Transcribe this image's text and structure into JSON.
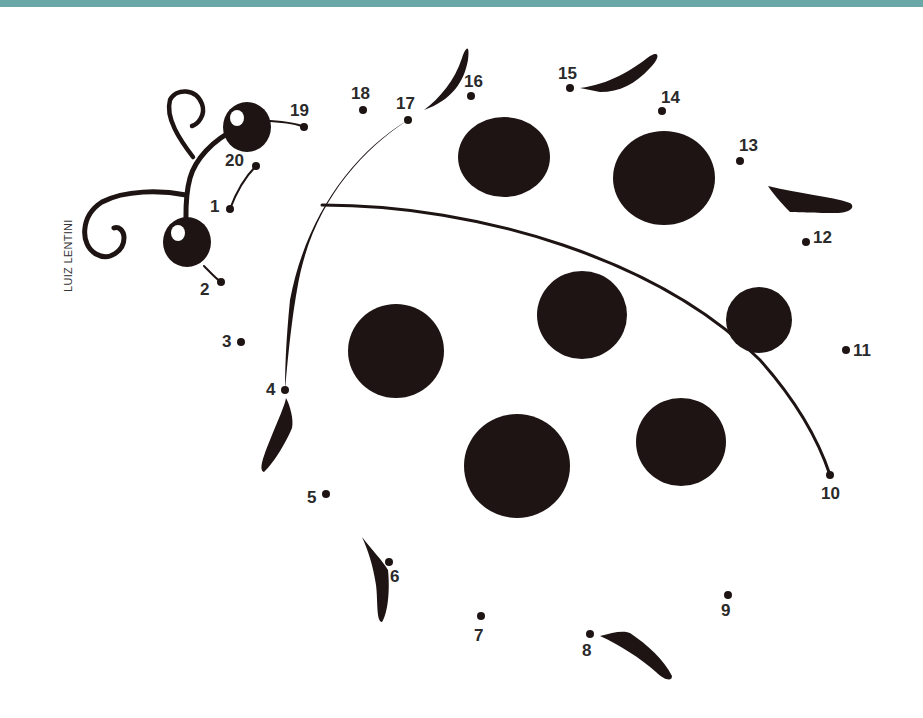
{
  "worksheet": {
    "subject": "ladybug",
    "type": "connect-the-dots",
    "credit": "LUIZ LENTINI",
    "top_bar_color": "#6aa8a8",
    "ink_color": "#1e1414",
    "eye_highlight_color": "#ffffff"
  },
  "dots": [
    {
      "n": "1",
      "x": 230,
      "y": 209,
      "lx": 210,
      "ly": 212
    },
    {
      "n": "2",
      "x": 221,
      "y": 282,
      "lx": 200,
      "ly": 295
    },
    {
      "n": "3",
      "x": 241,
      "y": 342,
      "lx": 222,
      "ly": 347
    },
    {
      "n": "4",
      "x": 285,
      "y": 390,
      "lx": 266,
      "ly": 395
    },
    {
      "n": "5",
      "x": 326,
      "y": 494,
      "lx": 307,
      "ly": 503
    },
    {
      "n": "6",
      "x": 389,
      "y": 562,
      "lx": 390,
      "ly": 582
    },
    {
      "n": "7",
      "x": 481,
      "y": 616,
      "lx": 474,
      "ly": 641
    },
    {
      "n": "8",
      "x": 590,
      "y": 634,
      "lx": 582,
      "ly": 656
    },
    {
      "n": "9",
      "x": 728,
      "y": 595,
      "lx": 721,
      "ly": 616
    },
    {
      "n": "10",
      "x": 830,
      "y": 475,
      "lx": 821,
      "ly": 499
    },
    {
      "n": "11",
      "x": 846,
      "y": 350,
      "lx": 853,
      "ly": 356
    },
    {
      "n": "12",
      "x": 806,
      "y": 242,
      "lx": 813,
      "ly": 243
    },
    {
      "n": "13",
      "x": 740,
      "y": 161,
      "lx": 739,
      "ly": 151
    },
    {
      "n": "14",
      "x": 662,
      "y": 111,
      "lx": 661,
      "ly": 103
    },
    {
      "n": "15",
      "x": 570,
      "y": 88,
      "lx": 558,
      "ly": 79
    },
    {
      "n": "16",
      "x": 471,
      "y": 96,
      "lx": 464,
      "ly": 87
    },
    {
      "n": "17",
      "x": 408,
      "y": 120,
      "lx": 396,
      "ly": 109
    },
    {
      "n": "18",
      "x": 363,
      "y": 110,
      "lx": 351,
      "ly": 99
    },
    {
      "n": "19",
      "x": 304,
      "y": 127,
      "lx": 290,
      "ly": 116
    },
    {
      "n": "20",
      "x": 256,
      "y": 166,
      "lx": 225,
      "ly": 166
    }
  ],
  "spots": [
    {
      "cx": 504,
      "cy": 157,
      "rx": 46,
      "ry": 40
    },
    {
      "cx": 664,
      "cy": 178,
      "rx": 51,
      "ry": 47
    },
    {
      "cx": 582,
      "cy": 315,
      "rx": 45,
      "ry": 44
    },
    {
      "cx": 759,
      "cy": 320,
      "rx": 33,
      "ry": 33
    },
    {
      "cx": 396,
      "cy": 351,
      "rx": 48,
      "ry": 47
    },
    {
      "cx": 517,
      "cy": 466,
      "rx": 53,
      "ry": 52
    },
    {
      "cx": 681,
      "cy": 442,
      "rx": 45,
      "ry": 44
    }
  ]
}
